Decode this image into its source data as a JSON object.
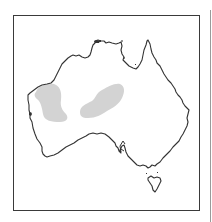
{
  "map": {
    "subject": "Australia distribution map",
    "colors": {
      "frame": "#3a3a3a",
      "coastline": "#333333",
      "shaded_region": "#d3d3d3",
      "background": "#ffffff",
      "edge_line": "#9a9a9a"
    },
    "regions": [
      {
        "name": "western-shaded-region"
      },
      {
        "name": "central-shaded-region"
      }
    ]
  }
}
